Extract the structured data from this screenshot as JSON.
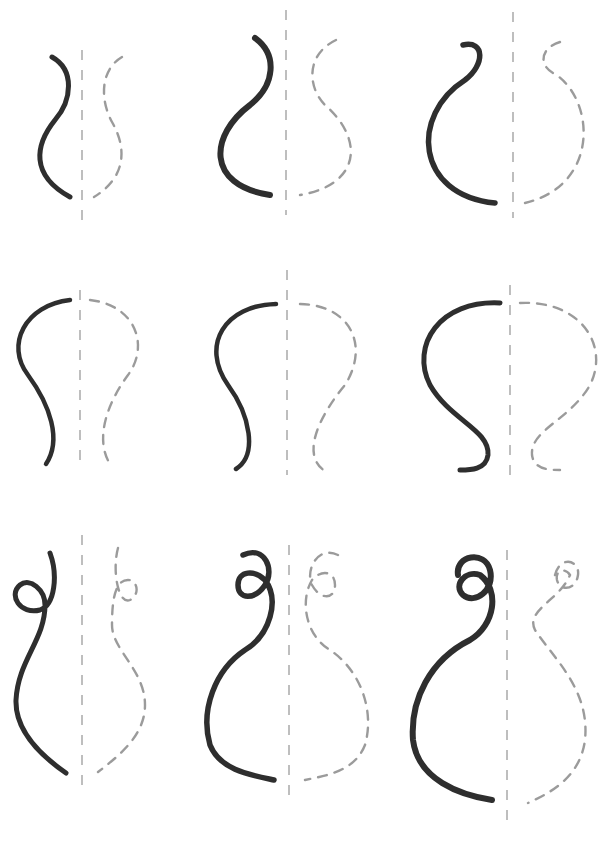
{
  "caption": "",
  "grid": {
    "rows": 3,
    "columns": 3,
    "description": "Nine pencil sketches of vase/jar silhouette halves: solid left contour mirrored by dashed right contour across a dashed vertical axis"
  },
  "colors": {
    "stroke": "#2e2e2e",
    "dashed": "#8a8a8a",
    "axis": "#9a9a9a",
    "background": "#ffffff"
  }
}
